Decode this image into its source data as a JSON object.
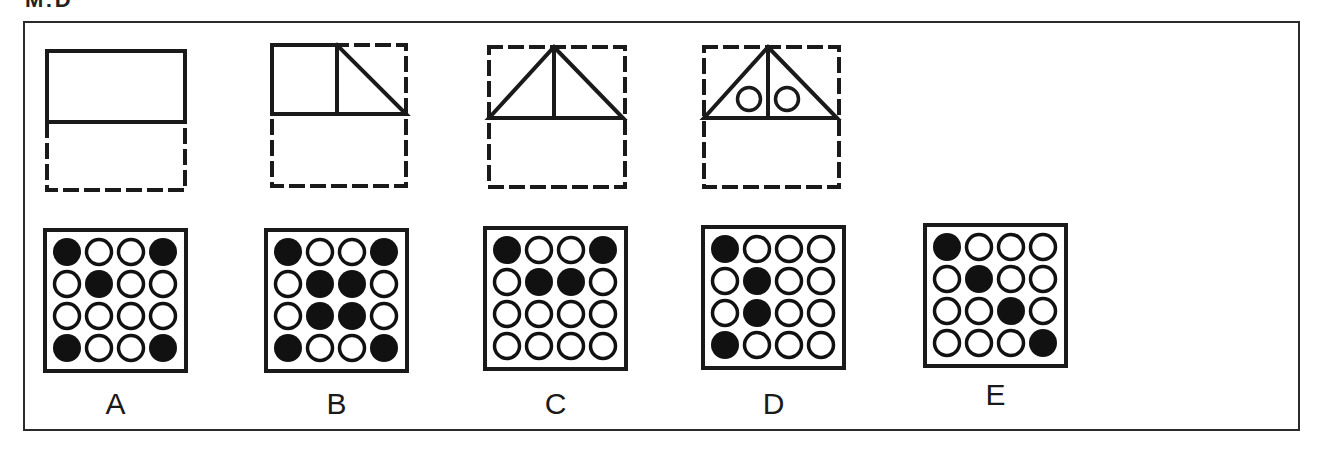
{
  "header": {
    "clipped_title": "M:D"
  },
  "colors": {
    "stroke": "#1a1a1a",
    "frame": "#2b2b2b",
    "fill_dark": "#111111",
    "background": "#ffffff"
  },
  "sequence_panels": [
    {
      "id": "panel-1",
      "description": "solid rectangle on top half of dashed square"
    },
    {
      "id": "panel-2",
      "description": "square plus right triangle on top half of dashed square"
    },
    {
      "id": "panel-3",
      "description": "triangle with vertical center line on top half of dashed square"
    },
    {
      "id": "panel-4",
      "description": "triangle with vertical center line and two circles"
    }
  ],
  "options": [
    {
      "label": "A",
      "grid": [
        [
          1,
          0,
          0,
          1
        ],
        [
          0,
          1,
          0,
          0
        ],
        [
          0,
          0,
          0,
          0
        ],
        [
          1,
          0,
          0,
          1
        ]
      ]
    },
    {
      "label": "B",
      "grid": [
        [
          1,
          0,
          0,
          1
        ],
        [
          0,
          1,
          1,
          0
        ],
        [
          0,
          1,
          1,
          0
        ],
        [
          1,
          0,
          0,
          1
        ]
      ]
    },
    {
      "label": "C",
      "grid": [
        [
          1,
          0,
          0,
          1
        ],
        [
          0,
          1,
          1,
          0
        ],
        [
          0,
          0,
          0,
          0
        ],
        [
          0,
          0,
          0,
          0
        ]
      ]
    },
    {
      "label": "D",
      "grid": [
        [
          1,
          0,
          0,
          0
        ],
        [
          0,
          1,
          0,
          0
        ],
        [
          0,
          1,
          0,
          0
        ],
        [
          1,
          0,
          0,
          0
        ]
      ]
    },
    {
      "label": "E",
      "grid": [
        [
          1,
          0,
          0,
          0
        ],
        [
          0,
          1,
          0,
          0
        ],
        [
          0,
          0,
          1,
          0
        ],
        [
          0,
          0,
          0,
          1
        ]
      ]
    }
  ]
}
